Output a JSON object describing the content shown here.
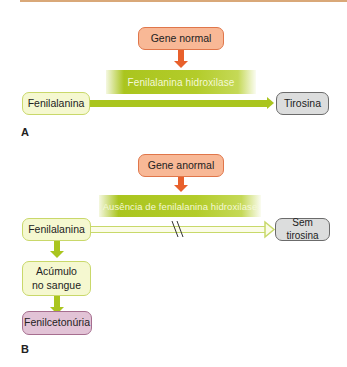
{
  "panel_a": {
    "label": "A",
    "gene": "Gene normal",
    "enzyme": "Fenilalanina hidroxilase",
    "substrate": "Fenilalanina",
    "product": "Tirosina"
  },
  "panel_b": {
    "label": "B",
    "gene": "Gene anormal",
    "enzyme": "Ausência de fenilalanina hidroxilase",
    "substrate": "Fenilalanina",
    "product": "Sem tirosina",
    "accumulation": "Acúmulo no sangue",
    "result": "Fenilcetonúria"
  },
  "colors": {
    "gene_fill": "#f8b896",
    "gene_border": "#e0764a",
    "orange_arrow": "#e8602c",
    "enzyme_green": "#aac51e",
    "substrate_fill": "#f5f8d0",
    "product_fill": "#dcdddd",
    "disease_fill": "#e2c3d6",
    "top_rule": "#d9a878"
  }
}
